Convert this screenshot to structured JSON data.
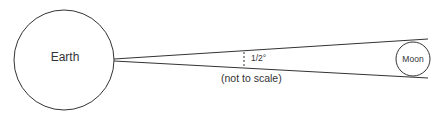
{
  "diagram": {
    "earth": {
      "label": "Earth"
    },
    "moon": {
      "label": "Moon"
    },
    "angle": {
      "label": "1/2°"
    },
    "note": "(not to scale)"
  },
  "colors": {
    "stroke": "#333333",
    "text": "#333333",
    "background": "#ffffff"
  }
}
